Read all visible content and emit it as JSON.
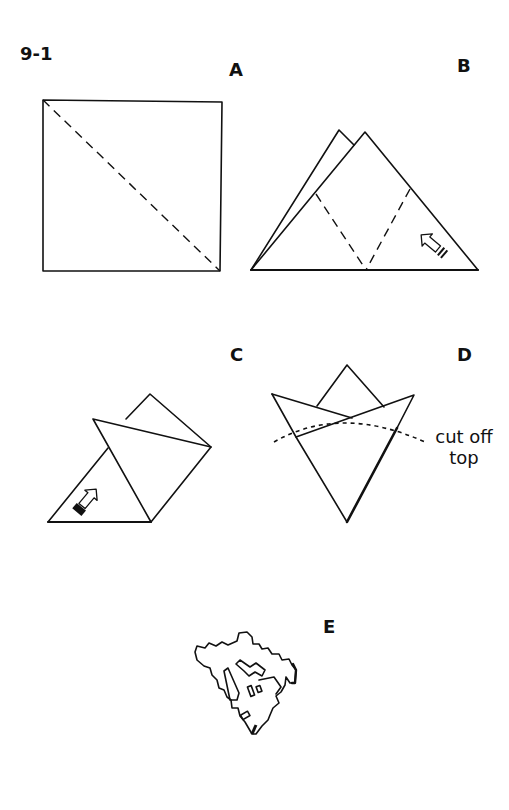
{
  "figure": {
    "number": "9-1",
    "panels": [
      {
        "id": "A",
        "label": "A",
        "description": "Square with dashed diagonal fold line"
      },
      {
        "id": "B",
        "label": "B",
        "description": "Folded triangle with two dashed fold lines and fold arrow"
      },
      {
        "id": "C",
        "label": "C",
        "description": "Triangle with right corner folded over and fold arrow"
      },
      {
        "id": "D",
        "label": "D",
        "description": "Folded cone with dotted cut line",
        "annotation": {
          "line1": "cut off",
          "line2": "top"
        }
      },
      {
        "id": "E",
        "label": "E",
        "description": "Cut-out paper snowflake wedge"
      }
    ]
  },
  "icons": {
    "fold_arrow_b": "curved-fold-arrow-icon",
    "fold_arrow_c": "curved-fold-arrow-icon"
  },
  "colors": {
    "line": "#111111",
    "background": "#ffffff"
  }
}
